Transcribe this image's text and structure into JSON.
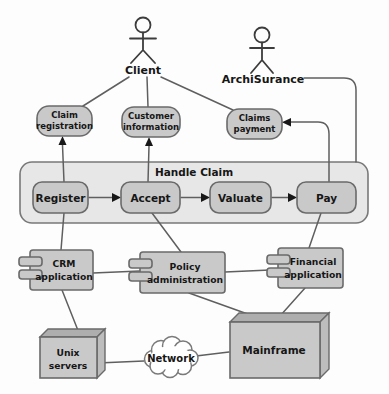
{
  "actors": {
    "client": {
      "label": "Client"
    },
    "archisurance": {
      "label": "ArchiSurance"
    }
  },
  "services": {
    "claim_registration": {
      "line1": "Claim",
      "line2": "registration"
    },
    "customer_information": {
      "line1": "Customer",
      "line2": "information"
    },
    "claims_payment": {
      "line1": "Claims",
      "line2": "payment"
    }
  },
  "process_group": {
    "label": "Handle Claim",
    "steps": {
      "register": "Register",
      "accept": "Accept",
      "valuate": "Valuate",
      "pay": "Pay"
    }
  },
  "applications": {
    "crm": {
      "line1": "CRM",
      "line2": "application"
    },
    "policy": {
      "line1": "Policy",
      "line2": "administration"
    },
    "financial": {
      "line1": "Financial",
      "line2": "application"
    }
  },
  "infrastructure": {
    "unix": {
      "line1": "Unix",
      "line2": "servers"
    },
    "network": {
      "label": "Network"
    },
    "mainframe": {
      "label": "Mainframe"
    }
  },
  "colors": {
    "background": "#fdfdfd",
    "node_fill": "#c9c9c9",
    "group_fill": "#e7e7e7",
    "box_top_face": "#aeaeae",
    "box_side_face": "#bdbdbd",
    "cloud_fill": "#ffffff",
    "border": "#6a6a6a",
    "connector": "#5f5f5f",
    "arrowhead": "#181818",
    "text": "#161616"
  }
}
